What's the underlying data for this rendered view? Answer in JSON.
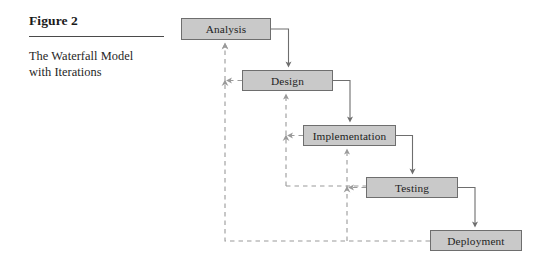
{
  "figure": {
    "number_label": "Figure 2",
    "caption": "The Waterfall Model with Iterations"
  },
  "diagram": {
    "type": "flowchart",
    "title": "Waterfall Model with Iterations",
    "colors": {
      "node_fill": "#c9c9c9",
      "node_border": "#6e6e6e",
      "forward_arrow": "#6e6e6e",
      "feedback_arrow": "#9a9a9a",
      "text": "#232323",
      "background": "#ffffff"
    },
    "nodes": [
      {
        "id": "analysis",
        "label": "Analysis",
        "x": 181,
        "y": 18,
        "w": 90,
        "h": 22
      },
      {
        "id": "design",
        "label": "Design",
        "x": 242,
        "y": 70,
        "w": 91,
        "h": 21
      },
      {
        "id": "implementation",
        "label": "Implementation",
        "x": 303,
        "y": 125,
        "w": 93,
        "h": 21
      },
      {
        "id": "testing",
        "label": "Testing",
        "x": 366,
        "y": 177,
        "w": 92,
        "h": 21
      },
      {
        "id": "deployment",
        "label": "Deployment",
        "x": 430,
        "y": 230,
        "w": 92,
        "h": 21
      }
    ],
    "forward_edges": [
      {
        "from": "analysis",
        "to": "design",
        "style": "solid"
      },
      {
        "from": "design",
        "to": "implementation",
        "style": "solid"
      },
      {
        "from": "implementation",
        "to": "testing",
        "style": "solid"
      },
      {
        "from": "testing",
        "to": "deployment",
        "style": "solid"
      }
    ],
    "feedback_edges": [
      {
        "from": "design",
        "to": "analysis",
        "style": "dashed"
      },
      {
        "from": "implementation",
        "to": "design",
        "style": "dashed"
      },
      {
        "from": "testing",
        "to": "implementation",
        "style": "dashed"
      },
      {
        "from": "deployment",
        "to": "analysis",
        "style": "dashed"
      },
      {
        "from": "deployment",
        "to": "implementation",
        "style": "dashed"
      }
    ]
  }
}
